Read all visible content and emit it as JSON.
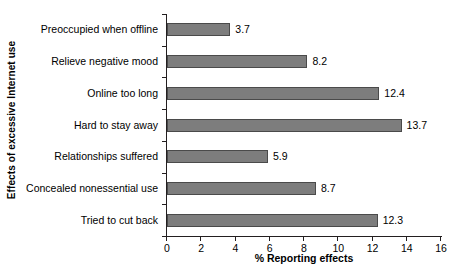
{
  "chart_data": {
    "type": "bar",
    "orientation": "horizontal",
    "title": "",
    "xlabel": "% Reporting effects",
    "ylabel": "Effects of excessive Internet use",
    "categories": [
      "Preoccupied when offline",
      "Relieve negative mood",
      "Online too long",
      "Hard to stay away",
      "Relationships suffered",
      "Concealed nonessential use",
      "Tried to cut back"
    ],
    "values": [
      3.7,
      8.2,
      12.4,
      13.7,
      5.9,
      8.7,
      12.3
    ],
    "value_labels": [
      "3.7",
      "8.2",
      "12.4",
      "13.7",
      "5.9",
      "8.7",
      "12.3"
    ],
    "xlim": [
      0,
      16
    ],
    "xticks": [
      0,
      2,
      4,
      6,
      8,
      10,
      12,
      14,
      16
    ],
    "xtick_labels": [
      "0",
      "2",
      "4",
      "6",
      "8",
      "10",
      "12",
      "14",
      "16"
    ],
    "grid": false,
    "legend": null,
    "bar_color": "#7d7d7d",
    "bar_border_color": "#4a4a4a",
    "axis_color": "#231f20",
    "background": "#ffffff"
  }
}
